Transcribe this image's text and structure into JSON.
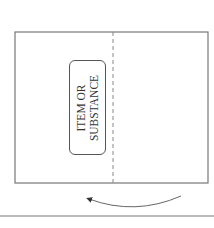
{
  "diagram": {
    "label_line1": "ITEM OR",
    "label_line2": "SUBSTANCE",
    "colors": {
      "stroke": "#666666",
      "text": "#333333",
      "background": "#ffffff"
    }
  }
}
